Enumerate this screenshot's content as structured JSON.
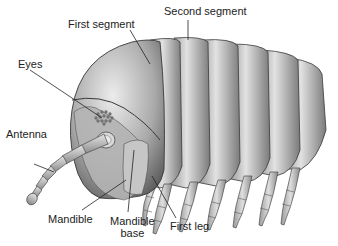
{
  "diagram": {
    "labels": {
      "first_segment": "First segment",
      "second_segment": "Second segment",
      "eyes": "Eyes",
      "antenna": "Antenna",
      "mandible": "Mandible",
      "mandible_base_line1": "Mandible",
      "mandible_base_line2": "base",
      "first_leg": "First leg"
    },
    "colors": {
      "background": "#ffffff",
      "body_light": "#d9d9d9",
      "body_mid": "#a8a8a8",
      "body_dark": "#5e5e5e",
      "outline": "#3a3a3a",
      "leader_line": "#222222",
      "text": "#222222"
    }
  }
}
